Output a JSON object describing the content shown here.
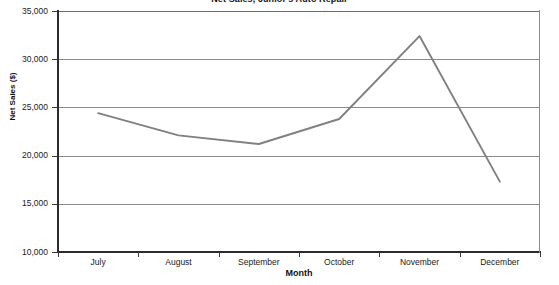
{
  "chart_data": {
    "type": "line",
    "title": "Net Sales, Junior's Auto Repair",
    "xlabel": "Month",
    "ylabel": "Net Sales ($)",
    "categories": [
      "July",
      "August",
      "September",
      "October",
      "November",
      "December"
    ],
    "values": [
      24400,
      22100,
      21200,
      23800,
      32400,
      17300
    ],
    "series": [
      {
        "name": "Net Sales",
        "values": [
          24400,
          22100,
          21200,
          23800,
          32400,
          17300
        ]
      }
    ],
    "ylim": [
      10000,
      35000
    ],
    "ytick_values": [
      35000,
      30000,
      25000,
      20000,
      15000,
      10000
    ],
    "ytick_labels": [
      "35,000",
      "30,000",
      "25,000",
      "20,000",
      "15,000",
      "10,000"
    ],
    "grid": true,
    "legend": "none",
    "line_color": "#808080",
    "grid_color": "#8a8a8a",
    "axis_color": "#2b2b2b"
  }
}
